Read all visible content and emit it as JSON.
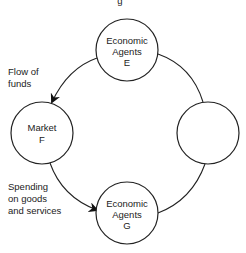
{
  "diagram": {
    "top_fragment": "g",
    "nodes": [
      {
        "id": "E",
        "lines": [
          "Economic",
          "Agents",
          "E"
        ],
        "cx": 127,
        "cy": 50,
        "r": 31
      },
      {
        "id": "F",
        "lines": [
          "Market",
          "F"
        ],
        "cx": 42,
        "cy": 133,
        "r": 31
      },
      {
        "id": "blank",
        "lines": [],
        "cx": 208,
        "cy": 133,
        "r": 31
      },
      {
        "id": "G",
        "lines": [
          "Economic",
          "Agents",
          "G"
        ],
        "cx": 127,
        "cy": 213,
        "r": 31
      }
    ],
    "annotations": {
      "flow_of_funds": [
        "Flow of",
        "funds"
      ],
      "spending": [
        "Spending",
        "on goods",
        "and services"
      ]
    },
    "edges": [
      {
        "from": "E",
        "to": "F",
        "arrow": true,
        "label": "Flow of funds"
      },
      {
        "from": "F",
        "to": "G",
        "arrow": true,
        "label": "Spending on goods and services"
      },
      {
        "from": "G",
        "to": "blank",
        "arrow": false
      },
      {
        "from": "blank",
        "to": "E",
        "arrow": false
      }
    ],
    "colors": {
      "stroke": "#222222",
      "background": "#ffffff"
    }
  }
}
